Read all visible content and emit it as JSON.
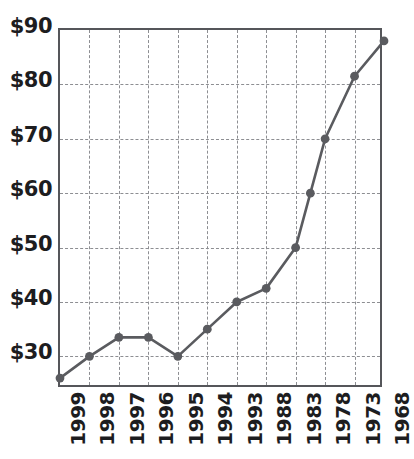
{
  "chart_data": {
    "type": "line",
    "title": "",
    "subtitle": "",
    "xlabel": "",
    "ylabel": "",
    "grid": true,
    "legend": null,
    "y_axis": {
      "tick_labels": [
        "$90",
        "$80",
        "$70",
        "$60",
        "$50",
        "$40",
        "$30"
      ],
      "tick_values": [
        90,
        80,
        70,
        60,
        50,
        40,
        30
      ],
      "ylim": [
        24,
        90
      ],
      "prefix": "$"
    },
    "x_axis": {
      "tick_labels": [
        "1999",
        "1998",
        "1997",
        "1996",
        "1995",
        "1994",
        "1993",
        "1988",
        "1983",
        "1978",
        "1973",
        "1968"
      ],
      "rotation": 90,
      "order": "descending-years-left-to-right"
    },
    "series": [
      {
        "name": "value",
        "color": "#5a5b5f",
        "marker": "circle",
        "points": [
          {
            "x_label": "1999",
            "x_index": 0,
            "value": 26.0
          },
          {
            "x_label": "1998",
            "x_index": 1,
            "value": 30.0
          },
          {
            "x_label": "1997",
            "x_index": 2,
            "value": 33.5
          },
          {
            "x_label": "1996",
            "x_index": 3,
            "value": 33.5
          },
          {
            "x_label": "1995",
            "x_index": 4,
            "value": 30.0
          },
          {
            "x_label": "1994",
            "x_index": 5,
            "value": 35.0
          },
          {
            "x_label": "1993",
            "x_index": 6,
            "value": 40.0
          },
          {
            "x_label": "1988",
            "x_index": 7,
            "value": 42.5
          },
          {
            "x_label": "1983",
            "x_index": 8,
            "value": 50.0
          },
          {
            "x_label": "",
            "x_index": 8.5,
            "value": 60.0
          },
          {
            "x_label": "1978",
            "x_index": 9,
            "value": 70.0
          },
          {
            "x_label": "1973",
            "x_index": 10,
            "value": 81.5
          },
          {
            "x_label": "1968",
            "x_index": 11,
            "value": 88.0
          }
        ]
      }
    ],
    "colors": {
      "line": "#5a5b5f",
      "marker": "#5a5b5f",
      "grid": "#8d8e92",
      "axis": "#55565a",
      "text": "#1d1d1f",
      "background": "#ffffff"
    }
  }
}
